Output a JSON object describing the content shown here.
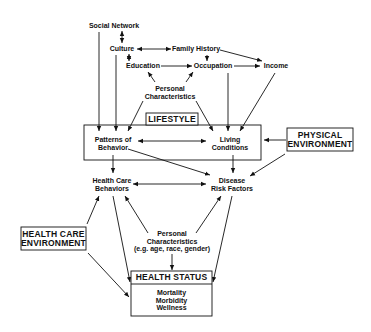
{
  "diagram": {
    "nodes": {
      "social_network": "Social Network",
      "culture": "Culture",
      "family_history": "Family History",
      "education": "Education",
      "occupation": "Occupation",
      "income": "Income",
      "personal_characteristics_top": [
        "Personal",
        "Characteristics"
      ],
      "lifestyle": "LIFESTYLE",
      "patterns_of_behavior": [
        "Patterns of",
        "Behavior"
      ],
      "living_conditions": [
        "Living",
        "Conditions"
      ],
      "physical_environment": [
        "PHYSICAL",
        "ENVIRONMENT"
      ],
      "health_care_behaviors": [
        "Health Care",
        "Behaviors"
      ],
      "disease_risk_factors": [
        "Disease",
        "Risk Factors"
      ],
      "health_care_environment": [
        "HEALTH CARE",
        "ENVIRONMENT"
      ],
      "personal_characteristics_bottom": [
        "Personal",
        "Characteristics",
        "(e.g. age, race, gender)"
      ],
      "health_status": "HEALTH STATUS",
      "health_status_items": [
        "Mortality",
        "Morbidity",
        "Wellness"
      ]
    },
    "colors": {
      "line": "#111111",
      "background": "#ffffff"
    }
  }
}
